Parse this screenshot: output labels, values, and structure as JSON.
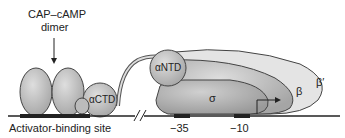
{
  "labels": {
    "cap_title_line1": "CAP–cAMP",
    "cap_title_line2": "dimer",
    "actd": "αCTD",
    "antd": "αNTD",
    "sigma": "σ",
    "beta": "β",
    "beta_prime": "β′",
    "activator_site": "Activator-binding site",
    "minus35": "−35",
    "minus10": "−10"
  },
  "colors": {
    "shape_fill": "#c8c8c8",
    "shape_dark": "#a9a9a9",
    "beta_prime_fill": "#e2e2e2",
    "line": "#222222"
  }
}
